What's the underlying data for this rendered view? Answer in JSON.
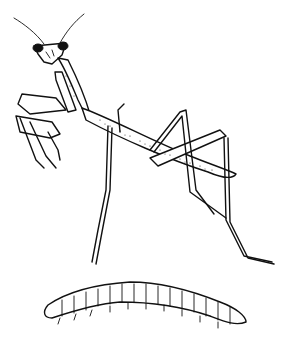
{
  "image": {
    "subjects": [
      {
        "name": "praying-mantis",
        "style": "pen-and-ink line drawing"
      },
      {
        "name": "larva",
        "style": "pen-and-ink line drawing",
        "segments": 13
      }
    ],
    "colors": {
      "background": "#ffffff",
      "ink": "#111111"
    }
  }
}
